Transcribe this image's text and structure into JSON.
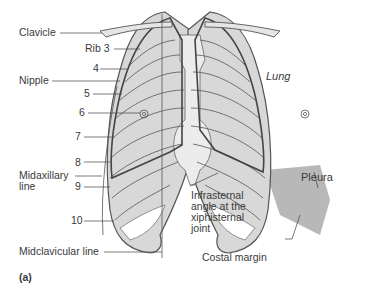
{
  "figure": {
    "panel_label": "(a)"
  },
  "labels": {
    "clavicle": "Clavicle",
    "rib3": "Rib 3",
    "rib4": "4",
    "nipple": "Nipple",
    "rib5": "5",
    "rib6": "6",
    "rib7": "7",
    "rib8": "8",
    "midaxillary_line_1": "Midaxillary",
    "midaxillary_line_2": "line",
    "rib9": "9",
    "rib10": "10",
    "midclavicular_line": "Midclavicular line",
    "lung": "Lung",
    "pleura": "Pleura",
    "infrasternal_1": "Infrasternal",
    "infrasternal_2": "angle at the",
    "infrasternal_3": "xiphisternal",
    "infrasternal_4": "joint",
    "costal_margin": "Costal margin"
  },
  "colors": {
    "bone_fill": "#e6e6e6",
    "lung_fill": "#d2d2d2",
    "pleura_fill": "#b4b4b4",
    "sternum_fill": "#ececec",
    "line": "#555555",
    "text": "#3a3a3a"
  }
}
